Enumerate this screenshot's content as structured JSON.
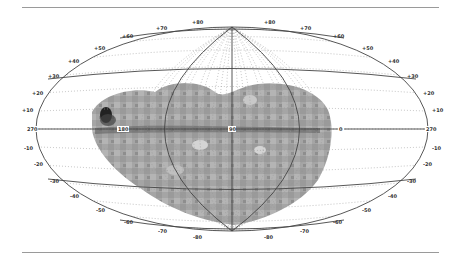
{
  "figure": {
    "projection": "Hammer-Aitoff all-sky",
    "coordinate_system": "galactic",
    "equator_labels": [
      "270",
      "180",
      "90",
      "0",
      "270"
    ],
    "latitude_labels_left": [
      "+10",
      "+20",
      "+30",
      "+40",
      "+50",
      "+60",
      "+70",
      "+80"
    ],
    "latitude_labels_right": [
      "+80",
      "+70",
      "+60",
      "+50",
      "+40",
      "+30",
      "+20",
      "+10"
    ],
    "latitude_labels_left_south": [
      "-10",
      "-20",
      "-30",
      "-40",
      "-50",
      "-60",
      "-70",
      "-80"
    ],
    "latitude_labels_right_south": [
      "-10",
      "-20",
      "-30",
      "-40",
      "-50",
      "-60",
      "-70",
      "-80"
    ],
    "colors": {
      "frame_line": "#444444",
      "grid_dotted": "#9a9a9a",
      "map_fill_dark": "#6a6a6a",
      "map_fill_mid": "#9c9c9c",
      "map_fill_light": "#c8c8c8",
      "rule": "#9a9a9a"
    }
  }
}
